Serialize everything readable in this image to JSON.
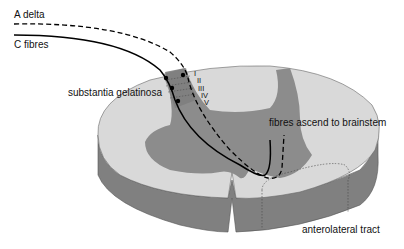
{
  "diagram": {
    "labels": {
      "a_delta": "A delta",
      "c_fibres": "C fibres",
      "substantia_gelatinosa": "substantia gelatinosa",
      "fibres_ascend": "fibres ascend to brainstem",
      "anterolateral_tract": "anterolateral tract"
    },
    "laminae": [
      "I",
      "II",
      "III",
      "IV",
      "V"
    ],
    "colors": {
      "white_matter": "#d9d9d9",
      "grey_matter": "#8c8c8c",
      "side": "#7f7f7f",
      "fibre": "#000000"
    }
  }
}
